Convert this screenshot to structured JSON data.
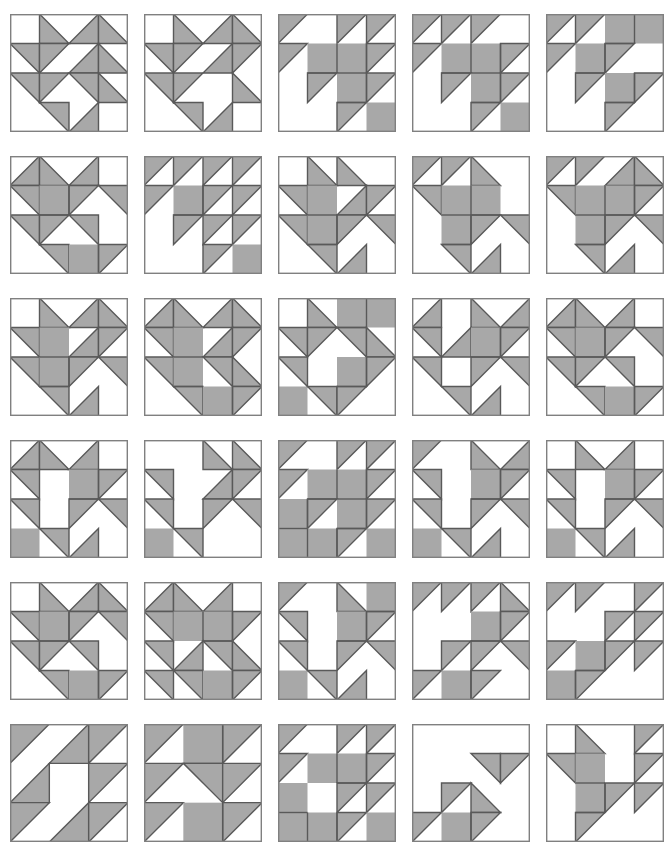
{
  "page": {
    "width": 664,
    "height": 862,
    "background_color": "#ffffff"
  },
  "style": {
    "fill_shaded": "#a8a8a8",
    "fill_empty": "#ffffff",
    "stroke_color": "#595959",
    "stroke_width": 1.4,
    "outline_color": "#808080",
    "outline_width": 1.4
  },
  "layout": {
    "columns": 5,
    "rows": 6,
    "block_size": 118,
    "col_step": 134,
    "row_step": 142,
    "origin_x": 10,
    "origin_y": 14
  },
  "legend": {
    "cell_codes": {
      "0": "empty / background square",
      "1": "fully shaded square",
      "tl": "triangle filling top-left corner",
      "tr": "triangle filling top-right corner",
      "bl": "triangle filling bottom-left corner",
      "br": "triangle filling bottom-right corner"
    }
  },
  "blocks": [
    {
      "index": 1,
      "row": 1,
      "col": 1,
      "grid": 4,
      "cells": [
        [
          "0",
          "bl",
          "br",
          "bl"
        ],
        [
          "tr",
          "tl",
          "br",
          "bl"
        ],
        [
          "tr",
          "tl",
          "tr",
          "bl"
        ],
        [
          "0",
          "tr",
          "br",
          "0"
        ]
      ]
    },
    {
      "index": 2,
      "row": 1,
      "col": 2,
      "grid": 4,
      "cells": [
        [
          "0",
          "bl",
          "br",
          "bl"
        ],
        [
          "tr",
          "tl",
          "br",
          "tl"
        ],
        [
          "tr",
          "tl",
          "0",
          "bl"
        ],
        [
          "0",
          "tr",
          "br",
          "0"
        ]
      ]
    },
    {
      "index": 3,
      "row": 1,
      "col": 3,
      "grid": 4,
      "cells": [
        [
          "tl",
          "0",
          "tl",
          "tl"
        ],
        [
          "tl",
          "1",
          "1",
          "tl"
        ],
        [
          "0",
          "tl",
          "1",
          "tl"
        ],
        [
          "0",
          "0",
          "tl",
          "1"
        ]
      ]
    },
    {
      "index": 4,
      "row": 1,
      "col": 4,
      "grid": 4,
      "cells": [
        [
          "tl",
          "tl",
          "tl",
          "0"
        ],
        [
          "tl",
          "1",
          "1",
          "tl"
        ],
        [
          "0",
          "tl",
          "1",
          "tl"
        ],
        [
          "0",
          "0",
          "tl",
          "1"
        ]
      ]
    },
    {
      "index": 5,
      "row": 1,
      "col": 5,
      "grid": 4,
      "cells": [
        [
          "tl",
          "tl",
          "1",
          "1"
        ],
        [
          "tl",
          "1",
          "tl",
          "0"
        ],
        [
          "0",
          "tl",
          "1",
          "tl"
        ],
        [
          "0",
          "0",
          "tl",
          "0"
        ]
      ]
    },
    {
      "index": 6,
      "row": 2,
      "col": 1,
      "grid": 4,
      "cells": [
        [
          "br",
          "bl",
          "br",
          "0"
        ],
        [
          "tr",
          "1",
          "tl",
          "tr"
        ],
        [
          "tr",
          "tl",
          "tr",
          "0"
        ],
        [
          "0",
          "tr",
          "1",
          "tl"
        ]
      ]
    },
    {
      "index": 7,
      "row": 2,
      "col": 2,
      "grid": 4,
      "cells": [
        [
          "tl",
          "tl",
          "tl",
          "tl"
        ],
        [
          "tl",
          "1",
          "tl",
          "tl"
        ],
        [
          "0",
          "tl",
          "tl",
          "tl"
        ],
        [
          "0",
          "0",
          "tl",
          "1"
        ]
      ]
    },
    {
      "index": 8,
      "row": 2,
      "col": 3,
      "grid": 4,
      "cells": [
        [
          "0",
          "bl",
          "bl",
          "0"
        ],
        [
          "tr",
          "1",
          "br",
          "tl"
        ],
        [
          "tr",
          "1",
          "tl",
          "tr"
        ],
        [
          "0",
          "tr",
          "br",
          "0"
        ]
      ]
    },
    {
      "index": 9,
      "row": 2,
      "col": 4,
      "grid": 4,
      "cells": [
        [
          "tl",
          "tl",
          "bl",
          "0"
        ],
        [
          "tr",
          "1",
          "1",
          "0"
        ],
        [
          "0",
          "1",
          "tl",
          "tr"
        ],
        [
          "0",
          "tr",
          "br",
          "0"
        ]
      ]
    },
    {
      "index": 10,
      "row": 2,
      "col": 5,
      "grid": 4,
      "cells": [
        [
          "tl",
          "tl",
          "br",
          "bl"
        ],
        [
          "tr",
          "1",
          "1",
          "tl"
        ],
        [
          "0",
          "1",
          "tl",
          "tr"
        ],
        [
          "0",
          "tr",
          "br",
          "0"
        ]
      ]
    },
    {
      "index": 11,
      "row": 3,
      "col": 1,
      "grid": 4,
      "cells": [
        [
          "0",
          "bl",
          "br",
          "bl"
        ],
        [
          "tr",
          "1",
          "br",
          "tl"
        ],
        [
          "tr",
          "1",
          "tl",
          "tr"
        ],
        [
          "0",
          "tr",
          "br",
          "0"
        ]
      ]
    },
    {
      "index": 12,
      "row": 3,
      "col": 2,
      "grid": 4,
      "cells": [
        [
          "br",
          "bl",
          "br",
          "bl"
        ],
        [
          "tr",
          "1",
          "br",
          "tl"
        ],
        [
          "tr",
          "1",
          "tr",
          "bl"
        ],
        [
          "0",
          "tr",
          "1",
          "tl"
        ]
      ]
    },
    {
      "index": 13,
      "row": 3,
      "col": 3,
      "grid": 4,
      "cells": [
        [
          "0",
          "bl",
          "1",
          "1"
        ],
        [
          "tr",
          "tl",
          "tr",
          "bl"
        ],
        [
          "tr",
          "0",
          "1",
          "tl"
        ],
        [
          "1",
          "tr",
          "tl",
          "0"
        ]
      ]
    },
    {
      "index": 14,
      "row": 3,
      "col": 4,
      "grid": 4,
      "cells": [
        [
          "br",
          "0",
          "bl",
          "br"
        ],
        [
          "tr",
          "br",
          "1",
          "tl"
        ],
        [
          "tr",
          "0",
          "tl",
          "tr"
        ],
        [
          "0",
          "tr",
          "br",
          "0"
        ]
      ]
    },
    {
      "index": 15,
      "row": 3,
      "col": 5,
      "grid": 4,
      "cells": [
        [
          "br",
          "bl",
          "br",
          "0"
        ],
        [
          "tr",
          "1",
          "tl",
          "tr"
        ],
        [
          "tr",
          "tl",
          "tr",
          "0"
        ],
        [
          "0",
          "tr",
          "1",
          "tl"
        ]
      ]
    },
    {
      "index": 16,
      "row": 4,
      "col": 1,
      "grid": 4,
      "cells": [
        [
          "br",
          "bl",
          "br",
          "0"
        ],
        [
          "tr",
          "0",
          "1",
          "tl"
        ],
        [
          "tr",
          "0",
          "tl",
          "tr"
        ],
        [
          "1",
          "tr",
          "br",
          "0"
        ]
      ]
    },
    {
      "index": 17,
      "row": 4,
      "col": 2,
      "grid": 4,
      "cells": [
        [
          "0",
          "0",
          "bl",
          "bl"
        ],
        [
          "tr",
          "0",
          "br",
          "tl"
        ],
        [
          "tr",
          "0",
          "tl",
          "tr"
        ],
        [
          "1",
          "tr",
          "0",
          "0"
        ]
      ]
    },
    {
      "index": 18,
      "row": 4,
      "col": 3,
      "grid": 4,
      "cells": [
        [
          "tl",
          "0",
          "tl",
          "tl"
        ],
        [
          "tl",
          "1",
          "1",
          "tl"
        ],
        [
          "1",
          "tl",
          "1",
          "tl"
        ],
        [
          "1",
          "1",
          "tl",
          "1"
        ]
      ]
    },
    {
      "index": 19,
      "row": 4,
      "col": 4,
      "grid": 4,
      "cells": [
        [
          "tl",
          "0",
          "bl",
          "br"
        ],
        [
          "tr",
          "0",
          "1",
          "tl"
        ],
        [
          "tr",
          "0",
          "tl",
          "tr"
        ],
        [
          "1",
          "tr",
          "br",
          "0"
        ]
      ]
    },
    {
      "index": 20,
      "row": 4,
      "col": 5,
      "grid": 4,
      "cells": [
        [
          "0",
          "bl",
          "br",
          "0"
        ],
        [
          "tr",
          "0",
          "1",
          "tl"
        ],
        [
          "tr",
          "0",
          "tl",
          "tr"
        ],
        [
          "1",
          "tr",
          "br",
          "0"
        ]
      ]
    },
    {
      "index": 21,
      "row": 5,
      "col": 1,
      "grid": 4,
      "cells": [
        [
          "0",
          "bl",
          "br",
          "bl"
        ],
        [
          "tr",
          "1",
          "tl",
          "tr"
        ],
        [
          "tr",
          "tl",
          "tr",
          "0"
        ],
        [
          "0",
          "tr",
          "1",
          "tl"
        ]
      ]
    },
    {
      "index": 22,
      "row": 5,
      "col": 2,
      "grid": 4,
      "cells": [
        [
          "br",
          "bl",
          "br",
          "0"
        ],
        [
          "tr",
          "1",
          "1",
          "tl"
        ],
        [
          "tr",
          "br",
          "tr",
          "bl"
        ],
        [
          "tr",
          "tr",
          "1",
          "tl"
        ]
      ]
    },
    {
      "index": 23,
      "row": 5,
      "col": 3,
      "grid": 4,
      "cells": [
        [
          "tl",
          "0",
          "bl",
          "1"
        ],
        [
          "tr",
          "0",
          "1",
          "tl"
        ],
        [
          "tr",
          "0",
          "tl",
          "tr"
        ],
        [
          "1",
          "tr",
          "br",
          "0"
        ]
      ]
    },
    {
      "index": 24,
      "row": 5,
      "col": 4,
      "grid": 4,
      "cells": [
        [
          "tl",
          "tl",
          "tl",
          "bl"
        ],
        [
          "0",
          "0",
          "1",
          "tl"
        ],
        [
          "0",
          "tl",
          "tl",
          "tr"
        ],
        [
          "tl",
          "1",
          "tl",
          "0"
        ]
      ]
    },
    {
      "index": 25,
      "row": 5,
      "col": 5,
      "grid": 4,
      "cells": [
        [
          "tl",
          "tl",
          "0",
          "tl"
        ],
        [
          "0",
          "0",
          "tl",
          "tl"
        ],
        [
          "tl",
          "1",
          "tl",
          "tl"
        ],
        [
          "1",
          "tl",
          "0",
          "0"
        ]
      ]
    },
    {
      "index": 26,
      "row": 6,
      "col": 1,
      "grid": 3,
      "cells": [
        [
          "tl",
          "br",
          "tl"
        ],
        [
          "br",
          "0",
          "tl"
        ],
        [
          "tl",
          "br",
          "tl"
        ]
      ]
    },
    {
      "index": 27,
      "row": 6,
      "col": 2,
      "grid": 3,
      "cells": [
        [
          "tl",
          "1",
          "tl"
        ],
        [
          "tl",
          "tr",
          "tl"
        ],
        [
          "tl",
          "1",
          "tl"
        ]
      ]
    },
    {
      "index": 28,
      "row": 6,
      "col": 3,
      "grid": 4,
      "cells": [
        [
          "tl",
          "0",
          "tl",
          "tl"
        ],
        [
          "tl",
          "1",
          "1",
          "tl"
        ],
        [
          "1",
          "0",
          "tl",
          "tl"
        ],
        [
          "1",
          "1",
          "tl",
          "1"
        ]
      ]
    },
    {
      "index": 29,
      "row": 6,
      "col": 4,
      "grid": 4,
      "cells": [
        [
          "0",
          "0",
          "0",
          "0"
        ],
        [
          "0",
          "0",
          "tr",
          "tl"
        ],
        [
          "0",
          "tl",
          "bl",
          "0"
        ],
        [
          "tl",
          "1",
          "tl",
          "0"
        ]
      ]
    },
    {
      "index": 30,
      "row": 6,
      "col": 5,
      "grid": 4,
      "cells": [
        [
          "0",
          "bl",
          "0",
          "tl"
        ],
        [
          "tr",
          "1",
          "0",
          "tl"
        ],
        [
          "0",
          "1",
          "tl",
          "tl"
        ],
        [
          "0",
          "tl",
          "0",
          "0"
        ]
      ]
    }
  ]
}
